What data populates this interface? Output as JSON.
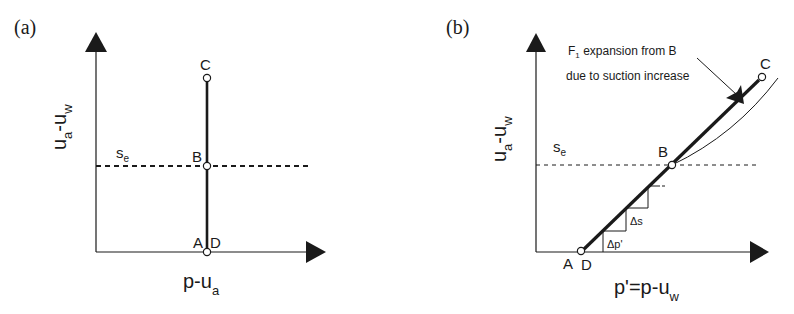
{
  "panel_a": {
    "label": "(a)",
    "y_axis": {
      "main": "u",
      "sub1": "a",
      "mid": "-u",
      "sub2": "w"
    },
    "x_axis": {
      "main": "p-u",
      "sub": "a"
    },
    "se_label": {
      "main": "s",
      "sub": "e"
    },
    "points": {
      "C": "C",
      "B": "B",
      "A": "A",
      "D": "D"
    }
  },
  "panel_b": {
    "label": "(b)",
    "y_axis": {
      "main": "u",
      "sub1": "a",
      "mid": "-u",
      "sub2": "w"
    },
    "x_axis": {
      "main": "p'=p-u",
      "sub": "w"
    },
    "se_label": {
      "main": "s",
      "sub": "e"
    },
    "points": {
      "C": "C",
      "B": "B",
      "A": "A",
      "D": "D"
    },
    "annotation": {
      "line1_main": "F",
      "line1_sub": "1",
      "line1_rest": " expansion from B",
      "line2": "due to suction increase"
    },
    "delta_s": "Δs",
    "delta_p": "Δp'"
  },
  "colors": {
    "ink": "#1a1a1a",
    "background": "#ffffff"
  }
}
